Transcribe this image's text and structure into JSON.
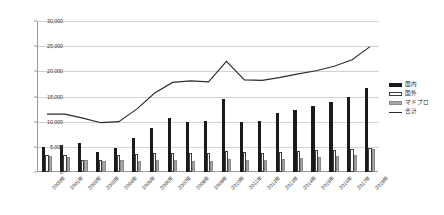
{
  "chart_data": {
    "type": "bar",
    "title": "",
    "xlabel": "",
    "ylabel": "",
    "ylim": [
      0,
      30000
    ],
    "ytick_step": 5000,
    "grid": true,
    "legend_position": "right",
    "categories": [
      "2000年",
      "2001年",
      "2002年",
      "2003年",
      "2004年",
      "2005年",
      "2006年",
      "2007年",
      "2008年",
      "2009年",
      "2010年",
      "2011年",
      "2012年",
      "2013年",
      "2014年",
      "2015年",
      "2016年",
      "2017年",
      "2018年"
    ],
    "ytick_labels": [
      "0",
      "5,000",
      "10,000",
      "15,000",
      "20,000",
      "25,000",
      "30,000"
    ],
    "ytick_values": [
      0,
      5000,
      10000,
      15000,
      20000,
      25000,
      30000
    ],
    "series": [
      {
        "name": "国内",
        "kind": "bar",
        "color": "#1a1a1a",
        "values": [
          5000,
          5400,
          5800,
          3900,
          4700,
          6700,
          8700,
          10800,
          10000,
          10200,
          14500,
          9900,
          10200,
          11700,
          12300,
          13100,
          14000,
          15000,
          16700
        ]
      },
      {
        "name": "国外",
        "kind": "bar",
        "color": "#ffffff",
        "values": [
          3300,
          3300,
          2400,
          2400,
          3300,
          3500,
          3800,
          3800,
          3800,
          3700,
          4200,
          3900,
          3800,
          3900,
          4100,
          4300,
          4400,
          4500,
          4700
        ]
      },
      {
        "name": "マドプロ",
        "kind": "bar",
        "color": "#a8a8a8",
        "values": [
          3100,
          2900,
          2400,
          2100,
          2400,
          2200,
          2400,
          2300,
          2100,
          2200,
          2600,
          2400,
          2400,
          2500,
          2700,
          2900,
          3100,
          3300,
          4500
        ]
      },
      {
        "name": "合計",
        "kind": "line",
        "color": "#2b2b2b",
        "values": [
          11500,
          11500,
          10700,
          9800,
          10000,
          12500,
          15700,
          17800,
          18100,
          17900,
          22000,
          18300,
          18200,
          18800,
          19500,
          20100,
          21000,
          22300,
          24900
        ]
      }
    ]
  },
  "legend": {
    "items": [
      {
        "label": "国内",
        "swatch": "domestic"
      },
      {
        "label": "国外",
        "swatch": "overseas"
      },
      {
        "label": "マドプロ",
        "swatch": "madrid"
      },
      {
        "label": "合計",
        "swatch": "total"
      }
    ]
  }
}
